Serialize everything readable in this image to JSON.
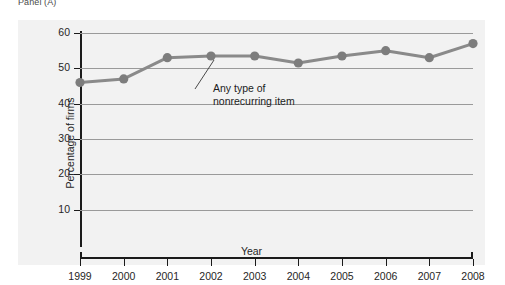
{
  "panel": {
    "caption": "Panel (A)"
  },
  "chart_data": {
    "type": "line",
    "title": "",
    "subtitle": "",
    "xlabel": "Year",
    "ylabel": "Percentage of firms",
    "categories": [
      "1999",
      "2000",
      "2001",
      "2002",
      "2003",
      "2004",
      "2005",
      "2006",
      "2007",
      "2008"
    ],
    "series": [
      {
        "name": "Any type of nonrecurring item",
        "values": [
          46,
          47,
          53,
          53.5,
          53.5,
          51.5,
          53.5,
          55,
          53,
          57
        ]
      }
    ],
    "ylim": [
      0,
      60
    ],
    "yticks": [
      10,
      20,
      30,
      40,
      50,
      60
    ],
    "ytick_labels": [
      "10",
      "20",
      "30",
      "40",
      "50",
      "60"
    ],
    "xtick_labels": [
      "1999",
      "2000",
      "2001",
      "2002",
      "2003",
      "2004",
      "2005",
      "2006",
      "2007",
      "2008"
    ],
    "grid": true,
    "legend_position": "none",
    "annotations": [
      {
        "text_line_1": "Any type of",
        "text_line_2": "nonrecurring item",
        "points_to": "2002"
      }
    ],
    "colors": {
      "line": "#8a8a8a",
      "marker": "#7d7d7d",
      "grid": "#9a9a9a",
      "axis": "#1b1b1b",
      "panel_background": "#f2f2f2",
      "page_background": "#ffffff",
      "text": "#262626"
    }
  }
}
